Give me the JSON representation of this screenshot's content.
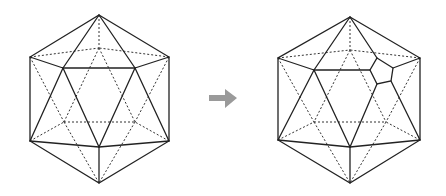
{
  "diagram": {
    "description": "Icosahedron wireframe transformed by truncating one vertex into a pentagon",
    "left_figure": {
      "name": "icosahedron",
      "vertices": {
        "top": [
          99,
          15
        ],
        "left": [
          30,
          57
        ],
        "right": [
          169,
          57
        ],
        "inner_top_left": [
          63,
          68
        ],
        "inner_top_right": [
          135,
          68
        ],
        "back_top": [
          99,
          48
        ],
        "back_lower_left": [
          64,
          122
        ],
        "back_lower_right": [
          135,
          122
        ],
        "bottom_left": [
          30,
          141
        ],
        "bottom_right": [
          169,
          141
        ],
        "inner_bottom": [
          99,
          147
        ],
        "bottom": [
          99,
          183
        ]
      }
    },
    "arrow": {
      "direction": "right",
      "color": "#9a9a9a"
    },
    "right_figure": {
      "name": "icosahedron-with-truncated-vertex",
      "vertices": {
        "top": [
          350,
          17
        ],
        "left": [
          278,
          58
        ],
        "right": [
          420,
          58
        ],
        "inner_top_left": [
          314,
          70
        ],
        "back_top": [
          350,
          50
        ],
        "back_lower_left": [
          314,
          122
        ],
        "back_lower_right": [
          386,
          122
        ],
        "bottom_left": [
          278,
          140
        ],
        "bottom_right": [
          420,
          140
        ],
        "inner_bottom": [
          350,
          147
        ],
        "bottom": [
          350,
          183
        ]
      },
      "pentagon": [
        [
          377,
          58
        ],
        [
          393,
          68
        ],
        [
          391,
          81
        ],
        [
          377,
          84
        ],
        [
          370,
          70
        ]
      ]
    },
    "line_color": "#222222"
  }
}
